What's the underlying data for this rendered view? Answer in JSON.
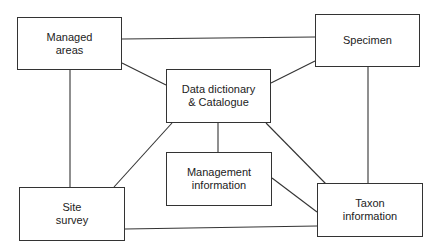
{
  "diagram": {
    "nodes": [
      {
        "id": "managed-areas",
        "label": "Managed\nareas"
      },
      {
        "id": "specimen",
        "label": "Specimen"
      },
      {
        "id": "data-dictionary",
        "label": "Data dictionary\n& Catalogue"
      },
      {
        "id": "management-information",
        "label": "Management\ninformation"
      },
      {
        "id": "site-survey",
        "label": "Site\nsurvey"
      },
      {
        "id": "taxon-information",
        "label": "Taxon\ninformation"
      }
    ],
    "edges": [
      {
        "from": "managed-areas",
        "to": "specimen"
      },
      {
        "from": "managed-areas",
        "to": "data-dictionary"
      },
      {
        "from": "specimen",
        "to": "data-dictionary"
      },
      {
        "from": "managed-areas",
        "to": "site-survey"
      },
      {
        "from": "specimen",
        "to": "taxon-information"
      },
      {
        "from": "data-dictionary",
        "to": "management-information"
      },
      {
        "from": "data-dictionary",
        "to": "site-survey"
      },
      {
        "from": "data-dictionary",
        "to": "taxon-information"
      },
      {
        "from": "management-information",
        "to": "taxon-information"
      },
      {
        "from": "site-survey",
        "to": "taxon-information"
      }
    ]
  }
}
